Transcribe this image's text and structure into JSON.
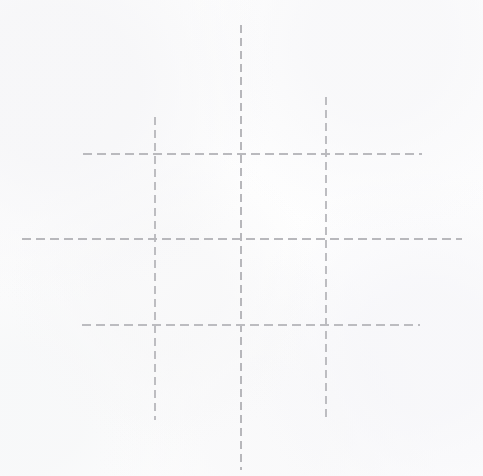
{
  "figure": {
    "kind": "tic-tac-toe-grid",
    "width": 483,
    "height": 476,
    "background_color": "#fefefe",
    "stroke_color": "#b9b9bd",
    "stroke_width_px": 1.3,
    "dash_length_px": 8,
    "dash_gap_px": 5,
    "line_style": "dashed"
  },
  "lines": [
    {
      "name": "vertical-line-left",
      "orientation": "vertical",
      "x": 155,
      "y_start": 117,
      "y_end": 420,
      "color": "#bdbdc1"
    },
    {
      "name": "vertical-line-center",
      "orientation": "vertical",
      "x": 241,
      "y_start": 25,
      "y_end": 470,
      "color": "#b7b7bb"
    },
    {
      "name": "vertical-line-right",
      "orientation": "vertical",
      "x": 326,
      "y_start": 97,
      "y_end": 418,
      "color": "#bdbdc1"
    },
    {
      "name": "horizontal-line-top",
      "orientation": "horizontal",
      "y": 154,
      "x_start": 83,
      "x_end": 422,
      "color": "#bababe"
    },
    {
      "name": "horizontal-line-middle",
      "orientation": "horizontal",
      "y": 239,
      "x_start": 22,
      "x_end": 462,
      "color": "#b8b8bc"
    },
    {
      "name": "horizontal-line-bottom",
      "orientation": "horizontal",
      "y": 325,
      "x_start": 82,
      "x_end": 420,
      "color": "#bcbcc0"
    }
  ],
  "cells": [
    {
      "name": "cell-top-left",
      "row": 1,
      "column": 1,
      "mark": ""
    },
    {
      "name": "cell-top-center",
      "row": 1,
      "column": 2,
      "mark": ""
    },
    {
      "name": "cell-top-right",
      "row": 1,
      "column": 3,
      "mark": ""
    },
    {
      "name": "cell-middle-left",
      "row": 2,
      "column": 1,
      "mark": ""
    },
    {
      "name": "cell-middle-center",
      "row": 2,
      "column": 2,
      "mark": ""
    },
    {
      "name": "cell-middle-right",
      "row": 2,
      "column": 3,
      "mark": ""
    },
    {
      "name": "cell-bottom-left",
      "row": 3,
      "column": 1,
      "mark": ""
    },
    {
      "name": "cell-bottom-center",
      "row": 3,
      "column": 2,
      "mark": ""
    },
    {
      "name": "cell-bottom-right",
      "row": 3,
      "column": 3,
      "mark": ""
    }
  ]
}
